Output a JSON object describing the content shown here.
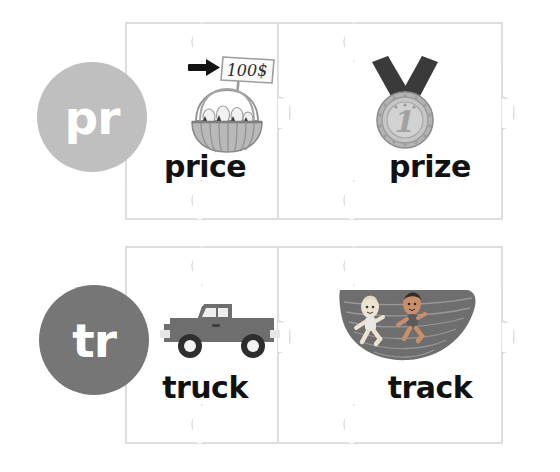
{
  "canvas": {
    "width": 560,
    "height": 472,
    "background": "#ffffff"
  },
  "colors": {
    "circle_pr": "#bfbfbf",
    "circle_tr": "#767676",
    "word_text": "#111111",
    "puzzle_fill": "#ffffff",
    "puzzle_stroke": "#d8d8d8",
    "truck_body": "#6e6e6e",
    "track_surface": "#6e6e6e",
    "ribbon": "#3b3b3b",
    "medal": "#b8b8b8",
    "basket": "#a8a8a8",
    "arrow": "#1a1a1a"
  },
  "rows": [
    {
      "sound": {
        "id": "pr",
        "label": "pr",
        "color": "#bfbfbf"
      },
      "pieces": [
        {
          "word": "price",
          "image": "basket-price-tag-illustration",
          "tag_text": "100$"
        },
        {
          "word": "prize",
          "image": "first-place-medal-illustration",
          "medal_number": "1"
        }
      ]
    },
    {
      "sound": {
        "id": "tr",
        "label": "tr",
        "color": "#767676"
      },
      "pieces": [
        {
          "word": "truck",
          "image": "pickup-truck-illustration"
        },
        {
          "word": "track",
          "image": "running-track-with-runners-illustration"
        }
      ]
    }
  ],
  "words": {
    "price": "price",
    "prize": "prize",
    "truck": "truck",
    "track": "track"
  },
  "sounds": {
    "pr": "pr",
    "tr": "tr"
  },
  "price_tag": {
    "amount": "100$"
  },
  "medal": {
    "place": "1"
  }
}
